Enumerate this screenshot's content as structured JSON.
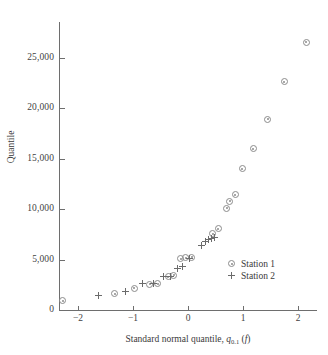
{
  "chart_data": {
    "type": "scatter",
    "title": "",
    "xlabel": "Standard normal quantile, q_{0.1} (f)",
    "xlabel_main": "Standard normal quantile, ",
    "xlabel_var": "q",
    "xlabel_sub": "0.1",
    "xlabel_tail": " (",
    "xlabel_f": "f",
    "xlabel_close": ")",
    "ylabel": "Quantile",
    "xlim": [
      -2.55,
      2.35
    ],
    "ylim": [
      0,
      28600
    ],
    "xticks": [
      -2,
      -1,
      0,
      1,
      2
    ],
    "xtick_labels": [
      "−2",
      "−1",
      "0",
      "1",
      "2"
    ],
    "yticks": [
      0,
      5000,
      10000,
      15000,
      20000,
      25000
    ],
    "ytick_labels": [
      "0",
      "5,000",
      "10,000",
      "15,000",
      "20,000",
      "25,000"
    ],
    "grid": false,
    "legend_position": "lower-right",
    "series": [
      {
        "name": "Station 1",
        "marker": "circle-dot",
        "color": "#8b8b8b",
        "points": [
          [
            -2.28,
            900
          ],
          [
            -1.33,
            1600
          ],
          [
            -0.98,
            2150
          ],
          [
            -0.7,
            2550
          ],
          [
            -0.55,
            2600
          ],
          [
            -0.36,
            3300
          ],
          [
            -0.26,
            3450
          ],
          [
            -0.13,
            5050
          ],
          [
            -0.04,
            5150
          ],
          [
            0.07,
            5200
          ],
          [
            0.45,
            7550
          ],
          [
            0.55,
            8050
          ],
          [
            0.7,
            10050
          ],
          [
            0.76,
            10750
          ],
          [
            0.86,
            11400
          ],
          [
            0.99,
            14000
          ],
          [
            1.19,
            15950
          ],
          [
            1.45,
            18900
          ],
          [
            1.75,
            22600
          ],
          [
            2.15,
            26500
          ]
        ]
      },
      {
        "name": "Station 2",
        "marker": "plus",
        "color": "#6b6b6b",
        "points": [
          [
            -1.63,
            1450
          ],
          [
            -1.13,
            1800
          ],
          [
            -0.83,
            2600
          ],
          [
            -0.62,
            2600
          ],
          [
            -0.44,
            3300
          ],
          [
            -0.31,
            3350
          ],
          [
            -0.19,
            4100
          ],
          [
            -0.1,
            4350
          ],
          [
            0.02,
            5050
          ],
          [
            0.25,
            6350
          ],
          [
            0.31,
            6800
          ],
          [
            0.37,
            6950
          ],
          [
            0.42,
            7050
          ],
          [
            0.49,
            7200
          ]
        ]
      }
    ]
  },
  "legend": {
    "items": [
      {
        "label": "Station 1",
        "marker": "circle-dot"
      },
      {
        "label": "Station 2",
        "marker": "plus"
      }
    ]
  }
}
